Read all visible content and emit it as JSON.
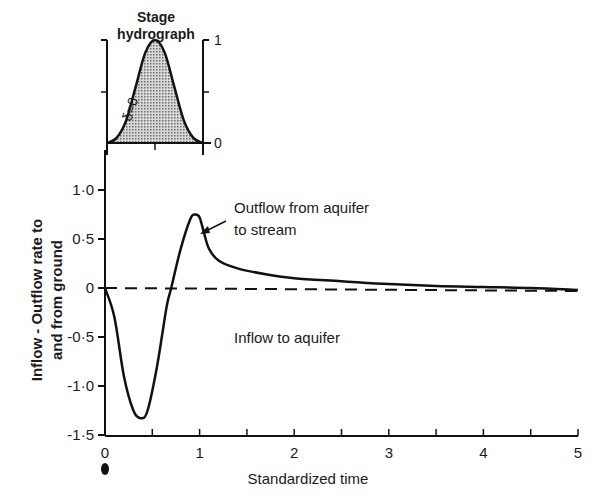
{
  "chart_data": [
    {
      "type": "line",
      "title": "",
      "xlabel": "Standardized time",
      "ylabel": "Inflow - Outflow rate to and from ground",
      "ylabel_lines": [
        "Inflow - Outflow rate to",
        "and from ground"
      ],
      "xlim": [
        0,
        5
      ],
      "ylim": [
        -1.5,
        1.0
      ],
      "x_ticks": [
        "0",
        "1",
        "2",
        "3",
        "4",
        "5"
      ],
      "y_ticks": [
        "1·0",
        "0·5",
        "0",
        "-0·5",
        "-1·0",
        "-1·5"
      ],
      "grid": false,
      "reference_line": {
        "y": 0,
        "style": "dashed"
      },
      "series": [
        {
          "name": "Inflow-Outflow rate",
          "x": [
            0,
            0.1,
            0.2,
            0.3,
            0.38,
            0.45,
            0.55,
            0.65,
            0.7,
            0.8,
            0.9,
            0.95,
            1.0,
            1.05,
            1.1,
            1.2,
            1.4,
            1.7,
            2.0,
            2.5,
            3.0,
            3.5,
            4.0,
            4.5,
            5.0
          ],
          "y": [
            0,
            -0.3,
            -0.9,
            -1.25,
            -1.33,
            -1.25,
            -0.8,
            -0.2,
            0.0,
            0.4,
            0.7,
            0.75,
            0.72,
            0.55,
            0.4,
            0.28,
            0.2,
            0.14,
            0.1,
            0.07,
            0.04,
            0.02,
            0.01,
            0.0,
            -0.02
          ]
        }
      ],
      "annotations": [
        {
          "text_lines": [
            "Outflow from aquifer",
            "to stream"
          ],
          "arrow_to": {
            "x": 1.0,
            "y": 0.6
          }
        },
        {
          "text_lines": [
            "Inflow to aquifer"
          ],
          "x": 1.4,
          "y": -0.45
        }
      ]
    },
    {
      "type": "area",
      "title": "Stage hydrograph",
      "title_lines": [
        "Stage",
        "hydrograph"
      ],
      "ylim": [
        0,
        1
      ],
      "y_ticks_right": [
        "1",
        "0"
      ],
      "curve_label": "δ=0",
      "series": [
        {
          "name": "Stage",
          "x": [
            0,
            0.1,
            0.2,
            0.3,
            0.4,
            0.5,
            0.6,
            0.7,
            0.8,
            0.9,
            1.0
          ],
          "y": [
            0,
            0.05,
            0.22,
            0.55,
            0.88,
            1.0,
            0.88,
            0.55,
            0.22,
            0.05,
            0
          ]
        }
      ]
    }
  ]
}
